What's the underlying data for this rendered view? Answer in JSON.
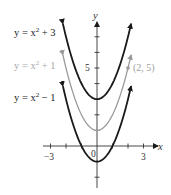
{
  "chart_data": {
    "type": "line",
    "title": "",
    "xlabel": "x",
    "ylabel": "y",
    "xlim": [
      -3.4,
      4
    ],
    "ylim": [
      -2.6,
      7.8
    ],
    "x_ticks": [
      -3,
      -2,
      -1,
      0,
      1,
      2,
      3
    ],
    "y_ticks": [
      -2,
      -1,
      1,
      2,
      3,
      4,
      5,
      6,
      7
    ],
    "x_tick_labels": [
      {
        "value": -3,
        "label": "−3"
      },
      {
        "value": 0,
        "label": "0"
      },
      {
        "value": 3,
        "label": "3"
      }
    ],
    "y_tick_labels": [
      {
        "value": 5,
        "label": "5"
      }
    ],
    "grid": false,
    "series": [
      {
        "name": "y = x² + 3",
        "expr": "x^2+3",
        "shift": 3,
        "color": "#1a1a1a",
        "x_range": [
          -2.2,
          2.2
        ]
      },
      {
        "name": "y = x² + 1",
        "expr": "x^2+1",
        "shift": 1,
        "color": "#9a9a9a",
        "x_range": [
          -2.2,
          2.2
        ]
      },
      {
        "name": "y = x² − 1",
        "expr": "x^2-1",
        "shift": -1,
        "color": "#1a1a1a",
        "x_range": [
          -2.2,
          2.2
        ]
      }
    ],
    "annotations": [
      {
        "type": "point",
        "x": 2,
        "y": 5,
        "label": "(2, 5)",
        "color": "#9a9a9a"
      }
    ]
  },
  "labels": {
    "top": "y = x² + 3",
    "mid": "y = x² + 1",
    "bot": "y = x² − 1",
    "point": "(2, 5)",
    "xaxis": "x",
    "yaxis": "y",
    "tick_neg3": "−3",
    "tick_0": "0",
    "tick_3": "3",
    "tick_5": "5"
  }
}
